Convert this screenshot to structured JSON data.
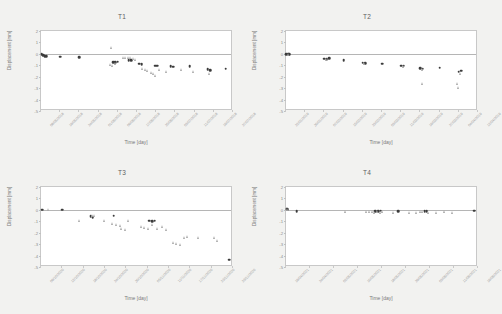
{
  "figure": {
    "background": "#f2f2f0",
    "panel_background": "#ffffff",
    "series_colors": {
      "circle": "#3b3b3b",
      "triangle": "#a9a9a9"
    }
  },
  "chart_data": [
    {
      "type": "scatter",
      "title": "T1",
      "xlabel": "Time [day]",
      "ylabel": "Displacement [mm]",
      "ylim": [
        -5,
        2
      ],
      "yticks": [
        2,
        1,
        0,
        -1,
        -2,
        -3,
        -4,
        -5
      ],
      "grid": false,
      "legend": "none",
      "xticklabels": [
        "08/05/2018",
        "16/05/2018",
        "24/05/2018",
        "01/06/2018",
        "09/06/2018",
        "17/06/2018",
        "25/06/2018",
        "03/07/2018",
        "11/07/2018",
        "19/07/2018",
        "27/07/2018"
      ],
      "xlim_days": [
        0,
        80
      ],
      "series": [
        {
          "name": "circle",
          "marker": "circle",
          "points": [
            [
              0.3,
              -0.05
            ],
            [
              1.0,
              -0.12
            ],
            [
              1.6,
              -0.18
            ],
            [
              2.2,
              -0.22
            ],
            [
              8.0,
              -0.25
            ],
            [
              16.0,
              -0.28
            ],
            [
              30.0,
              -0.75
            ],
            [
              31.0,
              -0.72
            ],
            [
              32.0,
              -0.7
            ],
            [
              36.5,
              -0.55
            ],
            [
              37.5,
              -0.58
            ],
            [
              41.0,
              -0.85
            ],
            [
              42.0,
              -0.88
            ],
            [
              47.5,
              -1.05
            ],
            [
              48.5,
              -1.02
            ],
            [
              54.0,
              -1.1
            ],
            [
              55.0,
              -1.12
            ],
            [
              62.0,
              -1.1
            ],
            [
              69.5,
              -1.35
            ],
            [
              70.5,
              -1.45
            ],
            [
              77.0,
              -1.3
            ]
          ]
        },
        {
          "name": "triangle",
          "marker": "triangle",
          "points": [
            [
              29.0,
              0.55
            ],
            [
              28.5,
              -0.95
            ],
            [
              29.5,
              -1.05
            ],
            [
              30.5,
              -0.8
            ],
            [
              34.0,
              -0.35
            ],
            [
              35.0,
              -0.3
            ],
            [
              36.0,
              -0.32
            ],
            [
              37.0,
              -0.28
            ],
            [
              38.0,
              -0.4
            ],
            [
              39.0,
              -0.45
            ],
            [
              42.0,
              -1.25
            ],
            [
              43.0,
              -1.35
            ],
            [
              44.0,
              -1.45
            ],
            [
              45.5,
              -1.6
            ],
            [
              46.5,
              -1.75
            ],
            [
              47.5,
              -1.85
            ],
            [
              49.0,
              -1.35
            ],
            [
              52.0,
              -1.55
            ],
            [
              58.0,
              -1.4
            ],
            [
              63.0,
              -1.5
            ],
            [
              70.0,
              -1.7
            ]
          ]
        }
      ]
    },
    {
      "type": "scatter",
      "title": "T2",
      "xlabel": "Time [day]",
      "ylabel": "Displacement [mm]",
      "ylim": [
        -5,
        2
      ],
      "yticks": [
        2,
        1,
        0,
        -1,
        -2,
        -3,
        -4,
        -5
      ],
      "grid": false,
      "legend": "none",
      "xticklabels": [
        "22/01/2019",
        "30/01/2019",
        "07/02/2019",
        "15/02/2019",
        "23/02/2019",
        "03/03/2019",
        "11/03/2019",
        "19/03/2019",
        "27/03/2019",
        "04/04/2019",
        "12/04/2019"
      ],
      "xlim_days": [
        0,
        80
      ],
      "series": [
        {
          "name": "circle",
          "marker": "circle",
          "points": [
            [
              0.2,
              -0.02
            ],
            [
              0.8,
              -0.05
            ],
            [
              1.4,
              -0.05
            ],
            [
              16.0,
              -0.42
            ],
            [
              17.0,
              -0.45
            ],
            [
              18.0,
              -0.4
            ],
            [
              24.0,
              -0.58
            ],
            [
              32.0,
              -0.78
            ],
            [
              33.0,
              -0.8
            ],
            [
              40.0,
              -0.85
            ],
            [
              48.0,
              -1.02
            ],
            [
              49.0,
              -1.05
            ],
            [
              56.0,
              -1.28
            ],
            [
              57.0,
              -1.3
            ],
            [
              64.0,
              -1.22
            ],
            [
              72.0,
              -1.55
            ],
            [
              73.0,
              -1.48
            ]
          ]
        },
        {
          "name": "triangle",
          "marker": "triangle",
          "points": [
            [
              0.5,
              -0.03
            ],
            [
              16.5,
              -0.48
            ],
            [
              32.5,
              -0.82
            ],
            [
              48.5,
              -1.08
            ],
            [
              56.5,
              -1.35
            ],
            [
              56.5,
              -2.55
            ],
            [
              71.0,
              -2.55
            ],
            [
              71.5,
              -2.95
            ],
            [
              72.5,
              -1.75
            ]
          ]
        }
      ]
    },
    {
      "type": "scatter",
      "title": "T3",
      "xlabel": "Time [day]",
      "ylabel": "Displacement [mm]",
      "ylim": [
        -5,
        2
      ],
      "yticks": [
        2,
        1,
        0,
        -1,
        -2,
        -3,
        -4,
        -5
      ],
      "grid": false,
      "legend": "none",
      "xticklabels": [
        "06/10/2020",
        "12/10/2020",
        "18/10/2020",
        "24/10/2020",
        "30/10/2020",
        "05/11/2020",
        "11/11/2020",
        "17/11/2020",
        "23/11/2020",
        "29/11/2020"
      ],
      "xlim_days": [
        0,
        54
      ],
      "series": [
        {
          "name": "circle",
          "marker": "circle",
          "points": [
            [
              0.3,
              0.0
            ],
            [
              6.0,
              0.0
            ],
            [
              14.0,
              -0.55
            ],
            [
              14.5,
              -0.62
            ],
            [
              20.5,
              -0.52
            ],
            [
              30.5,
              -0.95
            ],
            [
              31.3,
              -0.98
            ],
            [
              32.0,
              -0.95
            ],
            [
              53.0,
              -4.35
            ]
          ]
        },
        {
          "name": "triangle",
          "marker": "triangle",
          "points": [
            [
              2.0,
              0.0
            ],
            [
              10.5,
              -0.92
            ],
            [
              14.2,
              -0.45
            ],
            [
              14.8,
              -0.5
            ],
            [
              17.5,
              -0.9
            ],
            [
              20.0,
              -1.15
            ],
            [
              21.0,
              -1.25
            ],
            [
              22.0,
              -1.35
            ],
            [
              22.5,
              -1.6
            ],
            [
              23.5,
              -1.7
            ],
            [
              24.5,
              -0.95
            ],
            [
              28.0,
              -1.42
            ],
            [
              29.0,
              -1.5
            ],
            [
              30.0,
              -1.6
            ],
            [
              31.0,
              -1.3
            ],
            [
              32.5,
              -1.65
            ],
            [
              34.0,
              -1.45
            ],
            [
              35.0,
              -1.7
            ],
            [
              37.0,
              -2.85
            ],
            [
              38.0,
              -2.9
            ],
            [
              39.0,
              -3.05
            ],
            [
              40.0,
              -2.45
            ],
            [
              41.0,
              -2.35
            ],
            [
              44.0,
              -2.38
            ],
            [
              48.5,
              -2.45
            ],
            [
              49.5,
              -2.7
            ]
          ]
        }
      ]
    },
    {
      "type": "scatter",
      "title": "T4",
      "xlabel": "Time [day]",
      "ylabel": "Displacement [mm]",
      "ylim": [
        -5,
        2
      ],
      "yticks": [
        2,
        1,
        0,
        -1,
        -2,
        -3,
        -4,
        -5
      ],
      "grid": false,
      "legend": "none",
      "xticklabels": [
        "16/04/2021",
        "24/04/2021",
        "02/05/2021",
        "10/05/2021",
        "18/05/2021",
        "26/05/2021",
        "03/06/2021",
        "11/06/2021",
        "19/06/2021"
      ],
      "xlim_days": [
        0,
        72
      ],
      "series": [
        {
          "name": "circle",
          "marker": "circle",
          "points": [
            [
              0.2,
              0.1
            ],
            [
              0.5,
              0.05
            ],
            [
              4.0,
              -0.12
            ],
            [
              33.5,
              -0.1
            ],
            [
              34.5,
              -0.12
            ],
            [
              35.5,
              -0.08
            ],
            [
              42.0,
              -0.1
            ],
            [
              52.0,
              -0.12
            ],
            [
              52.8,
              -0.1
            ],
            [
              70.5,
              -0.08
            ]
          ]
        },
        {
          "name": "triangle",
          "marker": "triangle",
          "points": [
            [
              0.4,
              0.02
            ],
            [
              22.0,
              -0.14
            ],
            [
              30.0,
              -0.16
            ],
            [
              31.0,
              -0.14
            ],
            [
              32.0,
              -0.18
            ],
            [
              33.0,
              -0.2
            ],
            [
              34.0,
              -0.16
            ],
            [
              35.0,
              -0.22
            ],
            [
              36.0,
              -0.18
            ],
            [
              40.0,
              -0.2
            ],
            [
              46.0,
              -0.22
            ],
            [
              48.5,
              -0.2
            ],
            [
              50.0,
              -0.18
            ],
            [
              51.0,
              -0.16
            ],
            [
              53.0,
              -0.2
            ],
            [
              56.0,
              -0.22
            ],
            [
              59.0,
              -0.18
            ],
            [
              62.0,
              -0.2
            ]
          ]
        }
      ]
    }
  ]
}
